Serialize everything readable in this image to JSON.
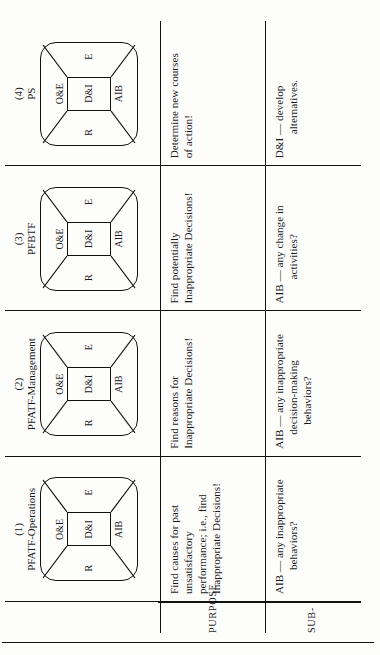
{
  "document": {
    "orientation": "rotated-90-ccw",
    "ink_color": "#111111",
    "paper_color": "#fdfdfc"
  },
  "row_labels": {
    "purpose": "PURPOSE",
    "subgoal": "SUB-"
  },
  "columns": [
    {
      "number": "(1)",
      "name": "PFATF-Operations",
      "diagram": {
        "top": "O&E",
        "bottom": "AIB",
        "left": "R",
        "right": "E",
        "center": "D&I"
      },
      "purpose": [
        "Find causes for past",
        "unsatisfactory",
        "performance; i.e., find",
        "Inappropriate Decisions!"
      ],
      "subgoal": [
        "AIB — any inappropriate",
        "behaviors?"
      ]
    },
    {
      "number": "(2)",
      "name": "PFATF-Management",
      "diagram": {
        "top": "O&E",
        "bottom": "AIB",
        "left": "R",
        "right": "E",
        "center": "D&I"
      },
      "purpose": [
        "Find reasons for",
        "Inappropriate Decisions!"
      ],
      "subgoal": [
        "AIB — any inappropriate",
        "decision-making",
        "behaviors?"
      ]
    },
    {
      "number": "(3)",
      "name": "PFBTF",
      "diagram": {
        "top": "O&E",
        "bottom": "AIB",
        "left": "R",
        "right": "E",
        "center": "D&I"
      },
      "purpose": [
        "Find potentially",
        "Inappropriate Decisions!"
      ],
      "subgoal": [
        "AIB — any change in",
        "activities?"
      ]
    },
    {
      "number": "(4)",
      "name": "PS",
      "diagram": {
        "top": "O&E",
        "bottom": "AIB",
        "left": "R",
        "right": "E",
        "center": "D&I"
      },
      "purpose": [
        "Determine new courses",
        "of action!"
      ],
      "subgoal": [
        "D&I — develop",
        "alternatives."
      ]
    }
  ]
}
